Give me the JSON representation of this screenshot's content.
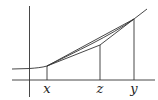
{
  "diagram": {
    "type": "convexity-illustration",
    "labels": {
      "x": "x",
      "z": "z",
      "y": "y"
    },
    "points": {
      "x": {
        "px": 47,
        "py": 66
      },
      "z": {
        "px": 100,
        "py": 45
      },
      "y": {
        "px": 134,
        "py": 19
      }
    },
    "colors": {
      "stroke": "#333333",
      "background": "#ffffff"
    }
  }
}
